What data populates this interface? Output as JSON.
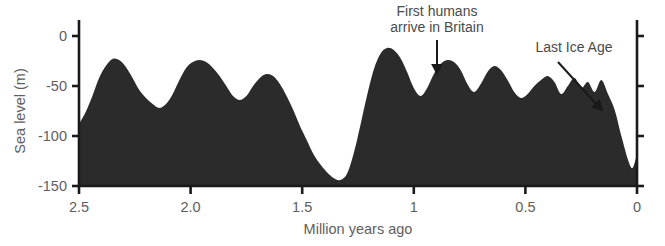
{
  "chart_data": {
    "type": "area",
    "title": "",
    "xlabel": "Million years ago",
    "ylabel": "Sea level (m)",
    "xlim": [
      2.5,
      0.0
    ],
    "ylim": [
      -150,
      10
    ],
    "x_reversed": true,
    "grid": false,
    "legend": null,
    "fill_color": "#2b2b2b",
    "axis_color": "#1a1a1a",
    "text_color": "#5e5e5e",
    "background": "#ffffff",
    "xticks": [
      2.5,
      2.0,
      1.5,
      1,
      0.5,
      0
    ],
    "xtick_labels": [
      "2.5",
      "2.0",
      "1.5",
      "1",
      "0.5",
      "0"
    ],
    "yticks": [
      0,
      -50,
      -100,
      -150
    ],
    "ytick_labels": [
      "0",
      "-50",
      "-100",
      "-150"
    ],
    "baseline": -150,
    "series_name": "Sea level",
    "x": [
      2.5,
      2.47,
      2.44,
      2.41,
      2.38,
      2.35,
      2.32,
      2.29,
      2.26,
      2.23,
      2.2,
      2.17,
      2.14,
      2.11,
      2.08,
      2.05,
      2.02,
      1.99,
      1.96,
      1.93,
      1.9,
      1.87,
      1.84,
      1.81,
      1.78,
      1.75,
      1.72,
      1.69,
      1.66,
      1.63,
      1.6,
      1.57,
      1.54,
      1.51,
      1.48,
      1.45,
      1.42,
      1.39,
      1.36,
      1.33,
      1.3,
      1.27,
      1.24,
      1.21,
      1.18,
      1.15,
      1.12,
      1.09,
      1.06,
      1.03,
      1.0,
      0.97,
      0.94,
      0.91,
      0.88,
      0.85,
      0.82,
      0.79,
      0.76,
      0.73,
      0.7,
      0.67,
      0.64,
      0.61,
      0.58,
      0.55,
      0.52,
      0.49,
      0.46,
      0.43,
      0.4,
      0.37,
      0.34,
      0.31,
      0.28,
      0.25,
      0.22,
      0.19,
      0.16,
      0.13,
      0.1,
      0.07,
      0.04,
      0.02,
      0.0
    ],
    "values": [
      -88,
      -76,
      -60,
      -42,
      -30,
      -23,
      -24,
      -31,
      -42,
      -54,
      -62,
      -68,
      -72,
      -68,
      -58,
      -44,
      -32,
      -26,
      -24,
      -26,
      -32,
      -40,
      -50,
      -60,
      -64,
      -60,
      -50,
      -42,
      -38,
      -40,
      -48,
      -60,
      -74,
      -90,
      -104,
      -118,
      -128,
      -136,
      -142,
      -144,
      -138,
      -118,
      -90,
      -60,
      -34,
      -18,
      -12,
      -14,
      -22,
      -36,
      -52,
      -60,
      -52,
      -38,
      -28,
      -24,
      -26,
      -34,
      -48,
      -56,
      -48,
      -36,
      -30,
      -34,
      -44,
      -56,
      -62,
      -58,
      -50,
      -44,
      -40,
      -46,
      -58,
      -50,
      -42,
      -52,
      -46,
      -56,
      -44,
      -58,
      -74,
      -100,
      -124,
      -132,
      -118
    ],
    "annotations": [
      {
        "name": "first-humans",
        "lines": [
          "First humans",
          "arrive in Britain"
        ],
        "text_x": 437,
        "text_y": 16,
        "text_anchor": "middle",
        "arrow": {
          "x1": 437,
          "y1": 40,
          "x2": 437,
          "y2": 69
        }
      },
      {
        "name": "last-ice-age",
        "lines": [
          "Last Ice Age"
        ],
        "text_x": 574,
        "text_y": 52,
        "text_anchor": "middle",
        "arrow": {
          "x1": 558,
          "y1": 62,
          "x2": 599,
          "y2": 107
        }
      }
    ]
  },
  "geometry": {
    "plot_left": 79,
    "plot_right": 637,
    "plot_top": 36,
    "plot_bottom": 186,
    "y_value_top": 0,
    "y_value_bottom": -150
  },
  "axis": {
    "y_title": "Sea level (m)",
    "x_title": "Million years ago"
  }
}
